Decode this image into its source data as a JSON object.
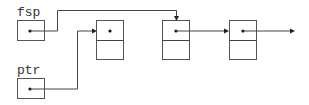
{
  "diagram": {
    "type": "linked-list-pointer-diagram",
    "variables": [
      {
        "name": "fsp",
        "points_to": "node-2"
      },
      {
        "name": "ptr",
        "points_to": "node-1"
      }
    ],
    "nodes": [
      {
        "id": "node-1",
        "next": null
      },
      {
        "id": "node-2",
        "next": "node-3"
      },
      {
        "id": "node-3",
        "next": "continues"
      }
    ],
    "colors": {
      "stroke": "#555555",
      "background": "#ffffff"
    }
  }
}
